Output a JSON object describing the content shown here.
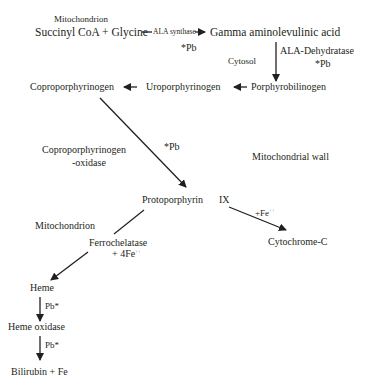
{
  "compartments": {
    "mitochondrion_top": "Mitochondrion",
    "cytosol": "Cytosol",
    "mitochondrial_wall": "Mitochondrial wall",
    "mitochondrion_bottom": "Mitochondrion"
  },
  "nodes": {
    "succinyl_glycine": "Succinyl CoA + Glycine",
    "ala": "Gamma aminolevulinic acid",
    "porphobilinogen": "Porphyrobilinogen",
    "uroporphyrinogen": "Uroporphyrinogen",
    "coproporphyrinogen": "Coproporphyrinogen",
    "protoporphyrin_a": "Protoporphyrin",
    "protoporphyrin_b": "IX",
    "cytochrome": "Cytochrome-C",
    "heme": "Heme",
    "heme_oxidase": "Heme oxidase",
    "bilirubin": "Bilirubin + Fe"
  },
  "enzymes": {
    "ala_synthase": "ALA synthase",
    "ala_dehydratase": "ALA-Dehydratase",
    "copro_oxidase_1": "Coproporphyrinogen",
    "copro_oxidase_2": "-oxidase",
    "ferrochelatase": "Ferrochelatase",
    "ferro_cofactor": "+ 4Fe",
    "cyto_cofactor": "+Fe",
    "charge": "++"
  },
  "inhibitors": {
    "pb_ala_synthase": "*Pb",
    "pb_ala_dehydratase": "*Pb",
    "pb_copro_oxidase": "*Pb",
    "pb_heme": "Pb*",
    "pb_heme_oxidase": "Pb*"
  },
  "colors": {
    "ink": "#231f20"
  }
}
